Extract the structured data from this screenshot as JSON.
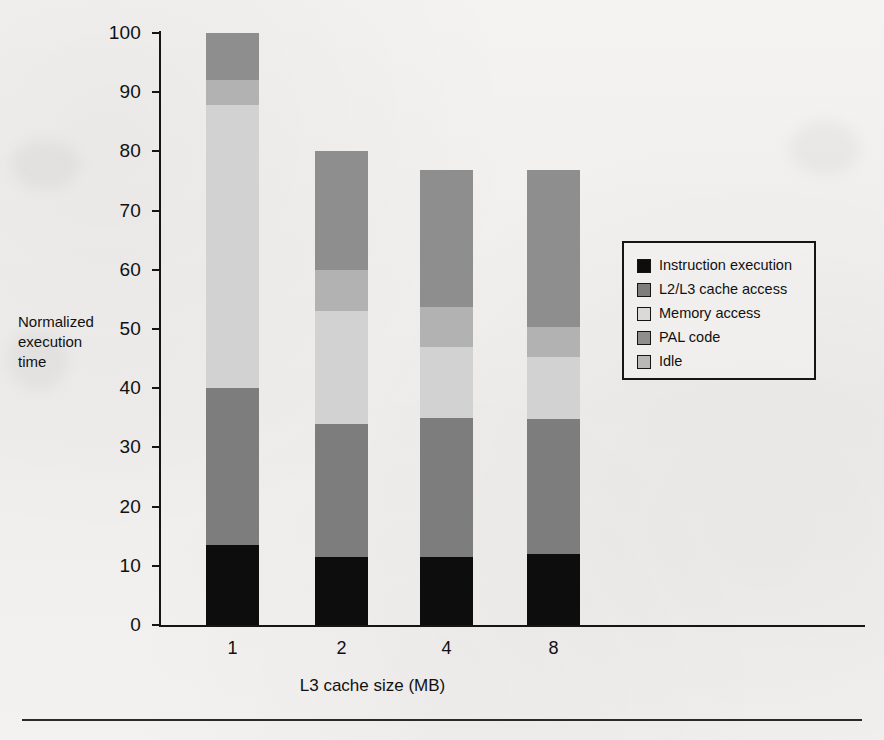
{
  "chart_data": {
    "type": "bar",
    "subtype": "stacked-bar",
    "title": "",
    "xlabel": "L3 cache size (MB)",
    "ylabel": "Normalized execution time",
    "ylabel_lines": [
      "Normalized",
      "execution",
      "time"
    ],
    "categories": [
      "1",
      "2",
      "4",
      "8"
    ],
    "ylim": [
      0,
      100
    ],
    "yticks": [
      0,
      10,
      20,
      30,
      40,
      50,
      60,
      70,
      80,
      90,
      100
    ],
    "grid": false,
    "legend_position": "center-right",
    "series": [
      {
        "name": "Instruction execution",
        "color": "#0d0d0d",
        "values": [
          13.5,
          11.5,
          11.5,
          12.0
        ]
      },
      {
        "name": "L2/L3 cache access",
        "color": "#7d7d7d",
        "values": [
          26.5,
          22.5,
          23.5,
          22.8
        ]
      },
      {
        "name": "Memory access",
        "color": "#d2d2d2",
        "values": [
          47.8,
          19.0,
          12.0,
          10.5
        ]
      },
      {
        "name": "PAL code",
        "color": "#8e8e8e",
        "values": [
          8.0,
          20.0,
          23.0,
          26.5
        ]
      },
      {
        "name": "Idle",
        "color": "#b2b2b2",
        "values": [
          4.2,
          7.0,
          6.8,
          5.0
        ]
      }
    ],
    "totals": [
      100.0,
      80.0,
      76.8,
      76.8
    ],
    "stack_order_bottom_to_top": [
      "Instruction execution",
      "L2/L3 cache access",
      "Memory access",
      "Idle",
      "PAL code"
    ]
  },
  "legend": {
    "items": [
      {
        "label": "Instruction execution",
        "color": "#0d0d0d"
      },
      {
        "label": "L2/L3 cache access",
        "color": "#7d7d7d"
      },
      {
        "label": "Memory access",
        "color": "#d9d9d9"
      },
      {
        "label": "PAL code",
        "color": "#8e8e8e"
      },
      {
        "label": "Idle",
        "color": "#b8b8b8"
      }
    ]
  }
}
